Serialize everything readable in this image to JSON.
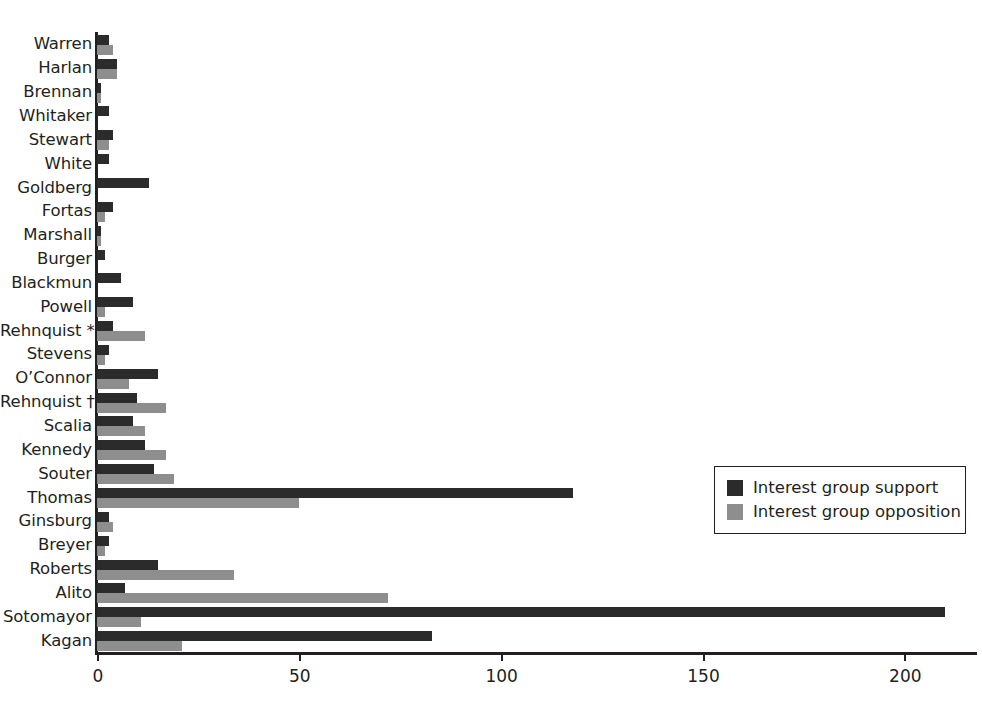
{
  "chart_data": {
    "type": "bar",
    "orientation": "horizontal",
    "title": "",
    "xlabel": "",
    "ylabel": "",
    "xlim": [
      0,
      218
    ],
    "xticks": [
      0,
      50,
      100,
      150,
      200
    ],
    "xtick_labels": [
      "0",
      "50",
      "100",
      "150",
      "200"
    ],
    "grid": false,
    "legend_position": "middle-right",
    "categories": [
      "Warren",
      "Harlan",
      "Brennan",
      "Whitaker",
      "Stewart",
      "White",
      "Goldberg",
      "Fortas",
      "Marshall",
      "Burger",
      "Blackmun",
      "Powell",
      "Rehnquist *",
      "Stevens",
      "O’Connor",
      "Rehnquist †",
      "Scalia",
      "Kennedy",
      "Souter",
      "Thomas",
      "Ginsburg",
      "Breyer",
      "Roberts",
      "Alito",
      "Sotomayor",
      "Kagan"
    ],
    "series": [
      {
        "name": "Interest group support",
        "color": "#2b2b2b",
        "values": [
          3,
          5,
          1,
          3,
          4,
          3,
          13,
          4,
          1,
          2,
          6,
          9,
          4,
          3,
          15,
          10,
          9,
          12,
          14,
          118,
          3,
          3,
          15,
          7,
          210,
          83
        ]
      },
      {
        "name": "Interest group opposition",
        "color": "#8e8e8e",
        "values": [
          4,
          5,
          1,
          0,
          3,
          0,
          0,
          2,
          1,
          0,
          0,
          2,
          12,
          2,
          8,
          17,
          12,
          17,
          19,
          50,
          4,
          2,
          34,
          72,
          11,
          21
        ]
      }
    ]
  },
  "legend": {
    "items": [
      {
        "label": "Interest group support",
        "swatch": "support"
      },
      {
        "label": "Interest group opposition",
        "swatch": "opposition"
      }
    ]
  }
}
